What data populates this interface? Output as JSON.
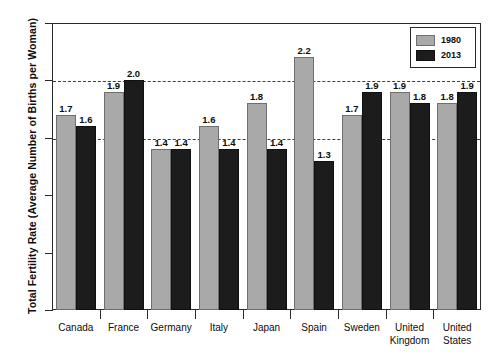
{
  "chart_data": {
    "type": "bar",
    "title": "",
    "xlabel": "",
    "ylabel": "Total Fertility Rate (Average Number of Births per Woman)",
    "ylim": [
      0.0,
      2.5
    ],
    "yticks": [
      "0.0",
      "0.5",
      "1.0",
      "1.5",
      "2.0",
      "2.5"
    ],
    "grid": "horizontal dashed at 1.5 and 2.0",
    "legend_position": "top-right inside plot",
    "categories": [
      "Canada",
      "France",
      "Germany",
      "Italy",
      "Japan",
      "Spain",
      "Sweden",
      "United Kingdom",
      "United States"
    ],
    "series": [
      {
        "name": "1980",
        "color": "#a9a9a9",
        "values": [
          1.7,
          1.9,
          1.4,
          1.6,
          1.8,
          2.2,
          1.7,
          1.9,
          1.8
        ],
        "labels": [
          "1.7",
          "1.9",
          "1.4",
          "1.6",
          "1.8",
          "2.2",
          "1.7",
          "1.9",
          "1.8"
        ]
      },
      {
        "name": "2013",
        "color": "#1c1c1c",
        "values": [
          1.6,
          2.0,
          1.4,
          1.4,
          1.4,
          1.3,
          1.9,
          1.8,
          1.9
        ],
        "labels": [
          "1.6",
          "2.0",
          "1.4",
          "1.4",
          "1.4",
          "1.3",
          "1.9",
          "1.8",
          "1.9"
        ]
      }
    ]
  },
  "legend": {
    "items": [
      {
        "label": "1980"
      },
      {
        "label": "2013"
      }
    ]
  }
}
